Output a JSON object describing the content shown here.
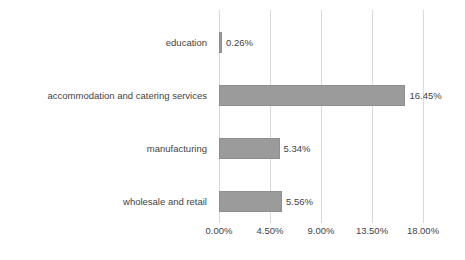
{
  "chart_data": {
    "type": "bar",
    "orientation": "horizontal",
    "title": "",
    "subtitle": "",
    "xlabel": "",
    "ylabel": "",
    "grid": true,
    "legend": false,
    "xlim": [
      0,
      18
    ],
    "categories": [
      "education",
      "accommodation and catering services",
      "manufacturing",
      "wholesale and retail"
    ],
    "values": [
      0.26,
      16.45,
      5.34,
      5.56
    ],
    "value_labels": [
      "0.26%",
      "16.45%",
      "5.34%",
      "5.56%"
    ],
    "tick_values": [
      0,
      4.5,
      9,
      13.5,
      18
    ],
    "tick_labels": [
      "0.00%",
      "4.50%",
      "9.00%",
      "13.50%",
      "18.00%"
    ],
    "bar_color": "#9b9b9b",
    "bar_border_color": "#8e8e8e",
    "gridline_color": "#d9d9d9",
    "text_color": "#3f3f3f",
    "background_color": "#ffffff"
  },
  "axis": {
    "ticks": [
      {
        "label": "0.00%",
        "value": 0
      },
      {
        "label": "4.50%",
        "value": 4.5
      },
      {
        "label": "9.00%",
        "value": 9
      },
      {
        "label": "13.50%",
        "value": 13.5
      },
      {
        "label": "18.00%",
        "value": 18
      }
    ]
  },
  "rows": [
    {
      "category": "education",
      "value": 0.26,
      "label": "0.26%"
    },
    {
      "category": "accommodation and catering services",
      "value": 16.45,
      "label": "16.45%"
    },
    {
      "category": "manufacturing",
      "value": 5.34,
      "label": "5.34%"
    },
    {
      "category": "wholesale and retail",
      "value": 5.56,
      "label": "5.56%"
    }
  ]
}
